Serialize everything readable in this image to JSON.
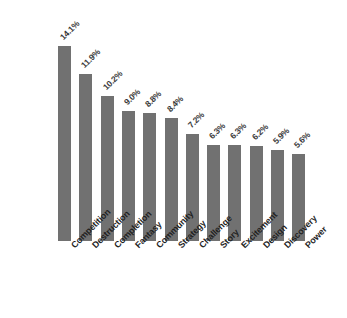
{
  "chart_data": {
    "type": "bar",
    "title": "",
    "subtitle": "",
    "xlabel": "",
    "ylabel": "",
    "ylim": [
      0,
      14.1
    ],
    "grid": false,
    "legend": false,
    "orientation": "vertical",
    "value_suffix": "%",
    "bar_color": "#717171",
    "label_color": "#3a3a3a",
    "category_color": "#1f1f1f",
    "background_color": "#ffffff",
    "categories": [
      "Competition",
      "Destruction",
      "Completion",
      "Fantasy",
      "Community",
      "Strategy",
      "Challenge",
      "Story",
      "Excitement",
      "Design",
      "Discovery",
      "Power"
    ],
    "values": [
      14.1,
      11.9,
      10.2,
      9.0,
      8.8,
      8.4,
      7.2,
      6.3,
      6.3,
      6.2,
      5.9,
      5.6
    ],
    "value_labels": [
      "14.1%",
      "11.9%",
      "10.2%",
      "9.0%",
      "8.8%",
      "8.4%",
      "7.2%",
      "6.3%",
      "6.3%",
      "6.2%",
      "5.9%",
      "5.6%"
    ]
  }
}
